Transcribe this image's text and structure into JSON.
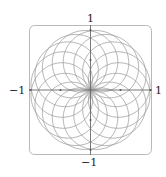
{
  "chart_data": {
    "type": "line",
    "title": "",
    "xlabel": "",
    "ylabel": "",
    "curve": "polar rose r = sin(k·θ)",
    "k_numerator": 8,
    "k_denominator": 9,
    "theta_range": [
      0,
      56.5487
    ],
    "xlim": [
      -1,
      1
    ],
    "ylim": [
      -1,
      1
    ],
    "tick_labels": {
      "top": "1",
      "bottom": "−1",
      "left": "−1",
      "right": "1"
    },
    "grid": false,
    "frame": "rounded box",
    "colors": {
      "curve": "#9a9a9a",
      "axes": "#6a6a6a",
      "frame": "#b8b8b8",
      "marker": "#555555"
    }
  }
}
